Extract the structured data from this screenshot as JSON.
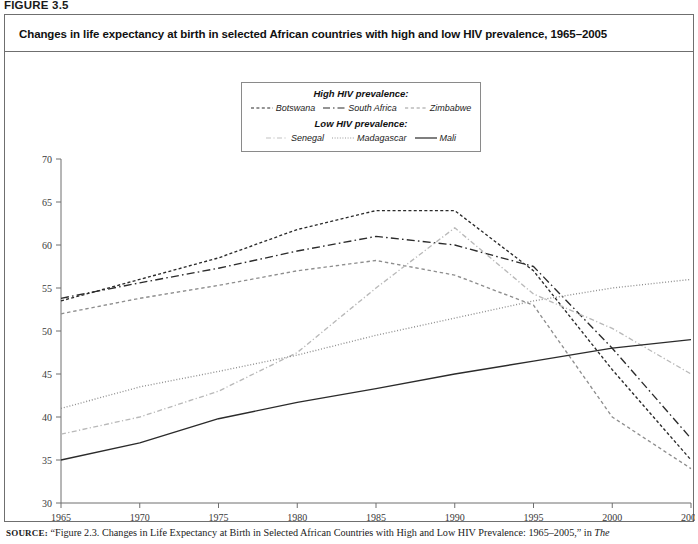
{
  "figure": {
    "number_label": "FIGURE 3.5",
    "title": "Changes in life expectancy at birth in selected African countries with high and low HIV prevalence, 1965–2005"
  },
  "legend": {
    "group_high_label": "High HIV prevalence:",
    "group_low_label": "Low HIV prevalence:",
    "items_high": [
      {
        "label": "Botswana",
        "style": "dashed-short",
        "color": "#2b2b2b"
      },
      {
        "label": "South Africa",
        "style": "dash-dot-long",
        "color": "#2b2b2b"
      },
      {
        "label": "Zimbabwe",
        "style": "dashed-medium",
        "color": "#8e8e8e"
      }
    ],
    "items_low": [
      {
        "label": "Senegal",
        "style": "dash-dot",
        "color": "#b9b9b9"
      },
      {
        "label": "Madagascar",
        "style": "dotted",
        "color": "#8e8e8e"
      },
      {
        "label": "Mali",
        "style": "solid",
        "color": "#2b2b2b"
      }
    ]
  },
  "axes": {
    "y_ticks": [
      "70",
      "65",
      "60",
      "55",
      "50",
      "45",
      "40",
      "35",
      "30"
    ],
    "x_ticks": [
      "1965",
      "1970",
      "1975",
      "1980",
      "1985",
      "1990",
      "1995",
      "2000",
      "2005"
    ]
  },
  "source": {
    "prefix": "SOURCE:",
    "text_before_italic": " “Figure 2.3. Changes in Life Expectancy at Birth in Selected African Countries with High and Low HIV Prevalence: 1965–2005,” in ",
    "italic_tail": "The"
  },
  "chart_data": {
    "type": "line",
    "title": "Changes in life expectancy at birth in selected African countries with high and low HIV prevalence, 1965–2005",
    "xlabel": "",
    "ylabel": "",
    "x": [
      1965,
      1970,
      1975,
      1980,
      1985,
      1990,
      1995,
      2000,
      2005
    ],
    "xlim": [
      1965,
      2005
    ],
    "ylim": [
      30,
      70
    ],
    "y_tick_values": [
      30,
      35,
      40,
      45,
      50,
      55,
      60,
      65,
      70
    ],
    "grid": false,
    "legend_position": "top-center",
    "series": [
      {
        "name": "Botswana",
        "group": "High HIV prevalence",
        "style": "dashed-short",
        "color": "#2b2b2b",
        "values": [
          53.5,
          56.0,
          58.5,
          61.8,
          64.0,
          64.0,
          57.0,
          45.5,
          35.0
        ]
      },
      {
        "name": "South Africa",
        "group": "High HIV prevalence",
        "style": "dash-dot-long",
        "color": "#2b2b2b",
        "values": [
          53.8,
          55.6,
          57.3,
          59.3,
          61.0,
          60.0,
          57.5,
          48.0,
          37.5
        ]
      },
      {
        "name": "Zimbabwe",
        "group": "High HIV prevalence",
        "style": "dashed-medium",
        "color": "#8e8e8e",
        "values": [
          52.0,
          53.8,
          55.3,
          57.0,
          58.2,
          56.5,
          53.0,
          40.0,
          34.0
        ]
      },
      {
        "name": "Senegal",
        "group": "Low HIV prevalence",
        "style": "dash-dot",
        "color": "#b9b9b9",
        "values": [
          38.0,
          40.0,
          43.0,
          47.5,
          55.0,
          62.0,
          54.3,
          50.3,
          45.0
        ]
      },
      {
        "name": "Madagascar",
        "group": "Low HIV prevalence",
        "style": "dotted",
        "color": "#8e8e8e",
        "values": [
          41.0,
          43.5,
          45.3,
          47.2,
          49.5,
          51.5,
          53.5,
          55.0,
          56.0
        ]
      },
      {
        "name": "Mali",
        "group": "Low HIV prevalence",
        "style": "solid",
        "color": "#2b2b2b",
        "values": [
          35.0,
          37.0,
          39.8,
          41.7,
          43.3,
          45.0,
          46.5,
          48.0,
          49.0
        ]
      }
    ]
  }
}
